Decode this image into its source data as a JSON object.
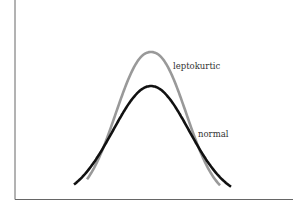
{
  "chart_data": {
    "type": "line",
    "title": "",
    "xlabel": "",
    "ylabel": "",
    "grid": false,
    "legend": "inline labels",
    "series": [
      {
        "name": "leptokurtic",
        "color": "#999999",
        "peak_relative": 1.0,
        "shape": "taller, narrower bell with thinner shoulders"
      },
      {
        "name": "normal",
        "color": "#111111",
        "peak_relative": 0.78,
        "shape": "standard bell curve"
      }
    ],
    "annotations": [
      {
        "text": "leptokurtic",
        "near": "right of leptokurtic peak"
      },
      {
        "text": "normal",
        "near": "right shoulder of normal curve"
      }
    ]
  },
  "labels": {
    "leptokurtic": "leptokurtic",
    "normal": "normal"
  },
  "colors": {
    "leptokurtic": "#999999",
    "normal": "#111111",
    "axis": "#555555"
  }
}
